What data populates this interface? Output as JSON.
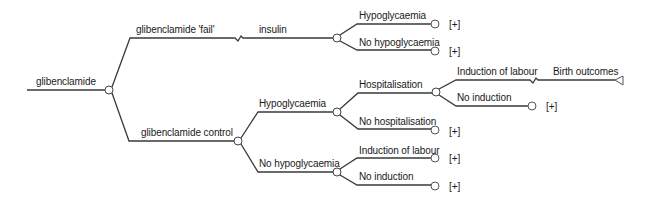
{
  "diagram": {
    "type": "decision-tree",
    "root": {
      "label": "glibenclamide"
    },
    "branches": {
      "fail": {
        "label": "glibenclamide 'fail'",
        "sub_label": "insulin"
      },
      "fail_hypo": {
        "label": "Hypoglycaemia",
        "expand": "[+]"
      },
      "fail_no_hypo": {
        "label": "No hypoglycaemia",
        "expand": "[+]"
      },
      "control": {
        "label": "glibenclamide control"
      },
      "control_hypo": {
        "label": "Hypoglycaemia"
      },
      "hospitalisation": {
        "label": "Hospitalisation"
      },
      "induction_hosp": {
        "label": "Induction of labour",
        "sub_label": "Birth outcomes"
      },
      "no_induction_hosp": {
        "label": "No induction",
        "expand": "[+]"
      },
      "no_hospitalisation": {
        "label": "No hospitalisation",
        "expand": "[+]"
      },
      "control_no_hypo": {
        "label": "No hypoglycaemia"
      },
      "induction": {
        "label": "Induction of labour",
        "expand": "[+]"
      },
      "no_induction": {
        "label": "No induction",
        "expand": "[+]"
      }
    },
    "colors": {
      "line": "#3a3a3a",
      "text": "#1a1a1a",
      "node_fill": "#ffffff"
    }
  }
}
